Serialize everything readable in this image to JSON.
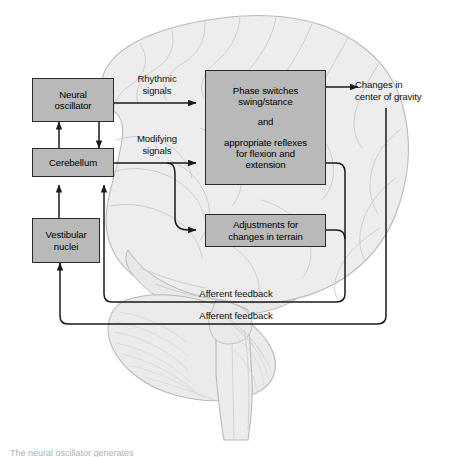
{
  "figure": {
    "caption": "The neural oscillator generates",
    "colors": {
      "background": "#ffffff",
      "brain_fill": "#ededed",
      "brain_stroke": "#b3b3b3",
      "box_fill": "#b9b9b9",
      "box_stroke": "#2b2b2b",
      "line": "#1a1a1a",
      "text": "#000000"
    }
  },
  "boxes": {
    "neural_oscillator": {
      "line1": "Neural",
      "line2": "oscillator"
    },
    "cerebellum": {
      "line1": "Cerebellum"
    },
    "vestibular_nuclei": {
      "line1": "Vestibular",
      "line2": "nuclei"
    },
    "phase_switches": {
      "line1": "Phase switches",
      "line2": "swing/stance",
      "line3": "and",
      "line4": "appropriate reflexes",
      "line5": "for flexion and",
      "line6": "extension"
    },
    "adjustments": {
      "line1": "Adjustments for",
      "line2": "changes in terrain"
    }
  },
  "labels": {
    "rhythmic_signals": {
      "line1": "Rhythmic",
      "line2": "signals"
    },
    "modifying_signals": {
      "line1": "Modifying",
      "line2": "signals"
    },
    "changes_center_gravity": {
      "line1": "Changes in",
      "line2": "center of gravity"
    },
    "afferent_feedback_upper": "Afferent feedback",
    "afferent_feedback_lower": "Afferent feedback"
  },
  "connections": [
    {
      "name": "neural-oscillator-to-phase-switches",
      "label": "Rhythmic signals",
      "arrow": "single"
    },
    {
      "name": "neural-oscillator-to-cerebellum",
      "label": "",
      "arrow": "down"
    },
    {
      "name": "cerebellum-to-neural-oscillator",
      "label": "",
      "arrow": "up"
    },
    {
      "name": "cerebellum-to-phase-switches",
      "label": "Modifying signals",
      "arrow": "single"
    },
    {
      "name": "cerebellum-to-adjustments",
      "label": "Modifying signals",
      "arrow": "single"
    },
    {
      "name": "vestibular-nuclei-to-cerebellum",
      "label": "",
      "arrow": "up"
    },
    {
      "name": "phase-switches-to-changes-in-center-of-gravity",
      "label": "",
      "arrow": "single"
    },
    {
      "name": "phase-switches-afferent-feedback-to-cerebellum",
      "label": "Afferent feedback",
      "arrow": "up"
    },
    {
      "name": "adjustments-afferent-feedback-to-cerebellum",
      "label": "Afferent feedback",
      "arrow": "up"
    },
    {
      "name": "center-of-gravity-afferent-feedback-to-vestibular-nuclei",
      "label": "Afferent feedback",
      "arrow": "up"
    }
  ]
}
